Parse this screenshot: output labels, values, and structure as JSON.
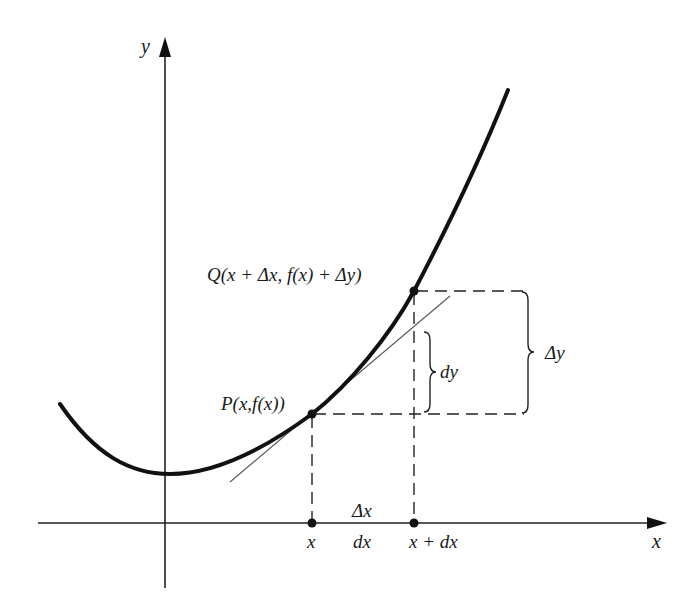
{
  "diagram": {
    "title": "",
    "axes": {
      "x_label": "x",
      "y_label": "y"
    },
    "points": {
      "P": {
        "label": "P(x,f(x))"
      },
      "Q": {
        "label": "Q(x + Δx, f(x) + Δy)"
      }
    },
    "x_axis_labels": {
      "x": "x",
      "delta_x": "Δx",
      "dx": "dx",
      "x_plus_dx": "x + dx"
    },
    "braces": {
      "dy": "dy",
      "delta_y": "Δy"
    },
    "colors": {
      "curve": "#111111",
      "axis": "#222222",
      "tangent": "#555555",
      "dashed": "#222222",
      "background": "#ffffff"
    }
  }
}
